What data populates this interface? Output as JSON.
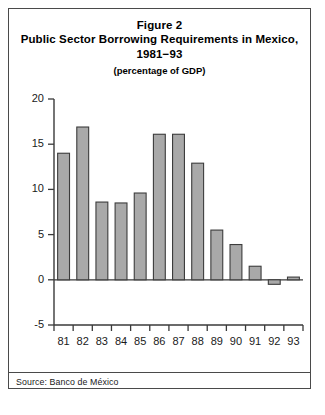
{
  "figure": {
    "label": "Figure 2",
    "title": "Public Sector Borrowing Requirements in Mexico, 1981−93",
    "subtitle": "(percentage of GDP)",
    "source": "Source: Banco de México"
  },
  "colors": {
    "bar_fill": "#a9a9a9",
    "bar_stroke": "#3c3c3c",
    "axis": "#3a3a3a",
    "frame": "#4a4a4a",
    "text": "#000000",
    "background": "#ffffff"
  },
  "chart_data": {
    "type": "bar",
    "title": "Public Sector Borrowing Requirements in Mexico, 1981−93",
    "subtitle": "(percentage of GDP)",
    "xlabel": "",
    "ylabel": "",
    "categories": [
      "81",
      "82",
      "83",
      "84",
      "85",
      "86",
      "87",
      "88",
      "89",
      "90",
      "91",
      "92",
      "93"
    ],
    "values": [
      14.0,
      16.9,
      8.6,
      8.5,
      9.6,
      16.1,
      16.1,
      12.9,
      5.5,
      3.9,
      1.5,
      -0.5,
      0.3
    ],
    "ylim": [
      -5,
      20
    ],
    "yticks": [
      20,
      15,
      10,
      5,
      0,
      -5
    ],
    "ytick_labels": [
      "20",
      "15",
      "10",
      "5",
      "0",
      "-5"
    ],
    "grid": false,
    "legend": null
  }
}
